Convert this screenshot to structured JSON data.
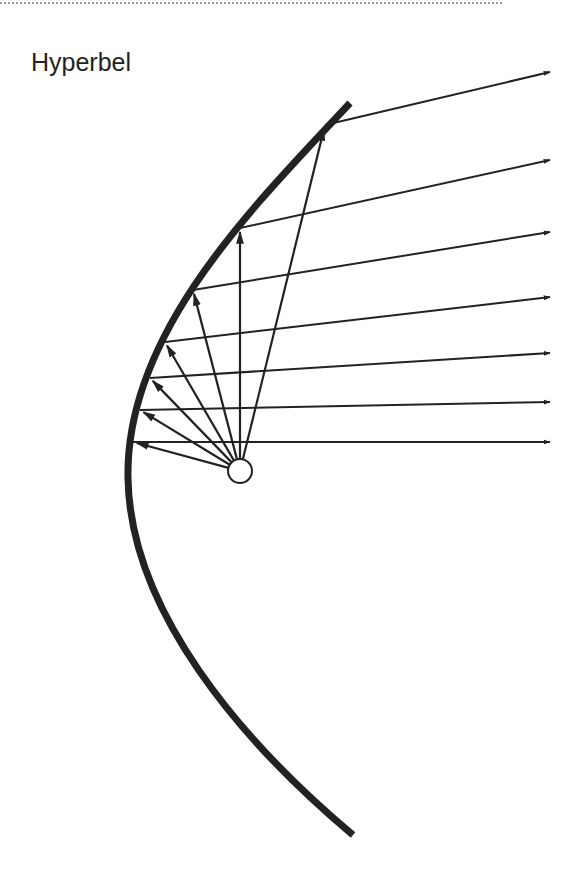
{
  "title": "Hyperbel",
  "colors": {
    "ink": "#222222",
    "rule": "#9a9a9a",
    "background": "#ffffff"
  },
  "diagram": {
    "focus": {
      "cx": 240,
      "cy": 471,
      "r": 12
    },
    "curve_path": "M 350 103 C 260 200, 125 330, 128 478 C 130 610, 240 740, 353 835",
    "rays": [
      {
        "hit": [
          325,
          125
        ],
        "out": [
          550,
          72
        ]
      },
      {
        "hit": [
          240,
          228
        ],
        "out": [
          550,
          160
        ]
      },
      {
        "hit": [
          193,
          290
        ],
        "out": [
          550,
          232
        ]
      },
      {
        "hit": [
          165,
          342
        ],
        "out": [
          550,
          297
        ]
      },
      {
        "hit": [
          150,
          378
        ],
        "out": [
          550,
          353
        ]
      },
      {
        "hit": [
          140,
          410
        ],
        "out": [
          550,
          402
        ]
      },
      {
        "hit": [
          133,
          442
        ],
        "out": [
          550,
          442
        ]
      }
    ]
  }
}
